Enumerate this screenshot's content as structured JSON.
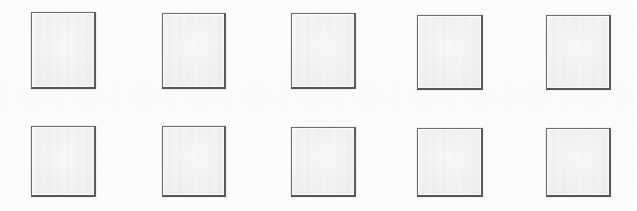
{
  "sheet": {
    "title": "Scanned sheet of blank cards",
    "width": 637,
    "height": 211,
    "background_color": "#ffffff",
    "paper_tint": "#fdfdfc"
  },
  "style": {
    "card_fill_color": "#f0f0ef",
    "card_border_color": "#5e5e5e",
    "card_border_top_color": "#6e6e6e",
    "card_border_bottom_color": "#565656",
    "card_highlight_color": "#ffffff"
  },
  "grid": {
    "rows": 2,
    "columns": 5,
    "total_cards": 10,
    "row_labels": [
      "top-row",
      "bottom-row"
    ]
  },
  "cards": [
    {
      "id": "card-1",
      "label": "",
      "row": 1,
      "column": 1,
      "x": 31,
      "y": 12,
      "width": 65,
      "height": 77
    },
    {
      "id": "card-2",
      "label": "",
      "row": 1,
      "column": 2,
      "x": 162,
      "y": 13,
      "width": 64,
      "height": 76
    },
    {
      "id": "card-3",
      "label": "",
      "row": 1,
      "column": 3,
      "x": 291,
      "y": 13,
      "width": 65,
      "height": 76
    },
    {
      "id": "card-4",
      "label": "",
      "row": 1,
      "column": 4,
      "x": 417,
      "y": 15,
      "width": 66,
      "height": 75
    },
    {
      "id": "card-5",
      "label": "",
      "row": 1,
      "column": 5,
      "x": 546,
      "y": 15,
      "width": 65,
      "height": 75
    },
    {
      "id": "card-6",
      "label": "",
      "row": 2,
      "column": 1,
      "x": 31,
      "y": 126,
      "width": 65,
      "height": 71
    },
    {
      "id": "card-7",
      "label": "",
      "row": 2,
      "column": 2,
      "x": 162,
      "y": 126,
      "width": 64,
      "height": 71
    },
    {
      "id": "card-8",
      "label": "",
      "row": 2,
      "column": 3,
      "x": 291,
      "y": 127,
      "width": 65,
      "height": 70
    },
    {
      "id": "card-9",
      "label": "",
      "row": 2,
      "column": 4,
      "x": 417,
      "y": 128,
      "width": 66,
      "height": 69
    },
    {
      "id": "card-10",
      "label": "",
      "row": 2,
      "column": 5,
      "x": 546,
      "y": 128,
      "width": 65,
      "height": 69
    }
  ]
}
